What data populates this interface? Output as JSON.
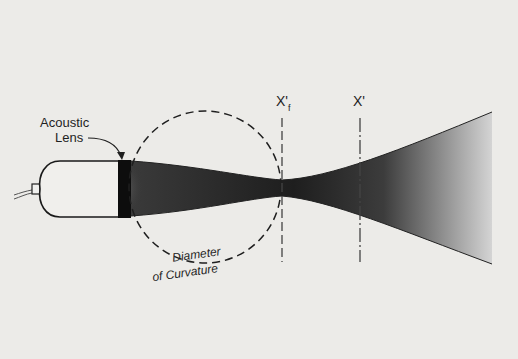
{
  "diagram": {
    "labels": {
      "lens_line1": "Acoustic",
      "lens_line2": "Lens",
      "focal_plane": "X'",
      "focal_sub": "f",
      "plane": "X'",
      "curvature_line1": "Diameter",
      "curvature_line2": "of Curvature"
    },
    "colors": {
      "background": "#ecebe8",
      "ink": "#1f1f1f",
      "beam_dark": "#2a2a2a",
      "beam_light": "#c9c9c9"
    }
  }
}
